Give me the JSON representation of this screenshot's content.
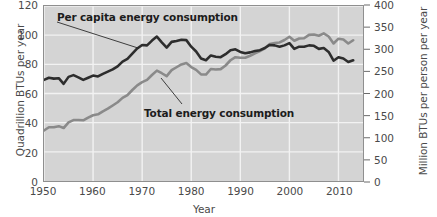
{
  "chart_data": {
    "type": "line",
    "title": "",
    "xlabel": "Year",
    "ylabel": "Quadrillion BTUs per year",
    "ylabel_right": "Million BTUs per person per year",
    "xlim": [
      1950,
      2015
    ],
    "ylim": [
      0,
      120
    ],
    "ylim_right": [
      0,
      400
    ],
    "grid": true,
    "legend": "inline-annotations",
    "xticks": [
      1950,
      1960,
      1970,
      1980,
      1990,
      2000,
      2010
    ],
    "xtick_labels": [
      "1950",
      "1960",
      "1970",
      "1980",
      "1990",
      "2000",
      "2010"
    ],
    "yticks_left": [
      0,
      20,
      40,
      60,
      80,
      100,
      120
    ],
    "ytick_labels_left": [
      "0",
      "20",
      "40",
      "60",
      "80",
      "100",
      "120"
    ],
    "yticks_right": [
      0,
      50,
      100,
      150,
      200,
      250,
      300,
      350,
      400
    ],
    "ytick_labels_right": [
      "0",
      "50",
      "100",
      "150",
      "200",
      "250",
      "300",
      "350",
      "400"
    ],
    "background": "#d4d4d4",
    "gridline_color": "#f2f2f2",
    "x": [
      1950,
      1951,
      1952,
      1953,
      1954,
      1955,
      1956,
      1957,
      1958,
      1959,
      1960,
      1961,
      1962,
      1963,
      1964,
      1965,
      1966,
      1967,
      1968,
      1969,
      1970,
      1971,
      1972,
      1973,
      1974,
      1975,
      1976,
      1977,
      1978,
      1979,
      1980,
      1981,
      1982,
      1983,
      1984,
      1985,
      1986,
      1987,
      1988,
      1989,
      1990,
      1991,
      1992,
      1993,
      1994,
      1995,
      1996,
      1997,
      1998,
      1999,
      2000,
      2001,
      2002,
      2003,
      2004,
      2005,
      2006,
      2007,
      2008,
      2009,
      2010,
      2011,
      2012,
      2013
    ],
    "series": [
      {
        "name": "Per capita energy consumption",
        "axis": "right",
        "units": "Million BTUs per person per year",
        "color": "#2d2d2d",
        "linewidth": 2.6,
        "values": [
          231,
          236,
          234,
          235,
          222,
          238,
          242,
          237,
          231,
          236,
          241,
          239,
          245,
          250,
          255,
          262,
          273,
          279,
          291,
          303,
          311,
          310,
          321,
          330,
          317,
          305,
          318,
          320,
          323,
          322,
          307,
          296,
          280,
          276,
          287,
          284,
          283,
          290,
          299,
          301,
          295,
          292,
          294,
          297,
          299,
          304,
          311,
          310,
          307,
          310,
          315,
          302,
          307,
          307,
          310,
          309,
          302,
          304,
          295,
          275,
          283,
          280,
          272,
          276
        ]
      },
      {
        "name": "Total energy consumption",
        "axis": "left",
        "units": "Quadrillion BTUs per year",
        "color": "#8a8a8a",
        "linewidth": 2.6,
        "values": [
          34.6,
          36.9,
          36.9,
          37.6,
          36.3,
          40.2,
          41.8,
          41.8,
          41.6,
          43.5,
          45.1,
          45.7,
          47.8,
          49.6,
          51.8,
          54.0,
          57.0,
          58.9,
          62.4,
          65.6,
          67.8,
          69.3,
          72.7,
          75.7,
          73.9,
          71.9,
          76.0,
          78.0,
          79.9,
          80.9,
          78.1,
          76.2,
          73.1,
          73.0,
          76.8,
          76.5,
          76.7,
          79.2,
          82.8,
          84.9,
          84.5,
          84.5,
          85.9,
          87.5,
          89.1,
          91.0,
          94.0,
          94.6,
          95.0,
          96.7,
          98.9,
          96.2,
          97.7,
          97.9,
          100.2,
          100.4,
          99.6,
          101.2,
          99.1,
          94.3,
          97.6,
          97.1,
          94.3,
          96.5
        ]
      }
    ],
    "annotations": [
      {
        "text": "Per capita energy consumption",
        "series": "Per capita energy consumption",
        "leader_from": [
          57,
          22
        ],
        "leader_to": [
          138,
          48
        ]
      },
      {
        "text": "Total energy consumption",
        "series": "Total energy consumption",
        "leader_from": [
          182,
          104
        ],
        "leader_to": [
          161,
          78
        ]
      }
    ]
  },
  "labels": {
    "y_left_title": "Quadrillion BTUs per year",
    "y_right_title": "Million BTUs per person per year",
    "x_title": "Year",
    "series_per_capita": "Per capita energy consumption",
    "series_total": "Total energy consumption"
  }
}
